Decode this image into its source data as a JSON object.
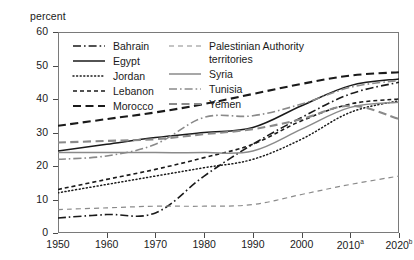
{
  "axis": {
    "y_title": "percent",
    "y_ticks": [
      0,
      10,
      20,
      30,
      40,
      50,
      60
    ],
    "x_ticks": [
      "1950",
      "1960",
      "1970",
      "1980",
      "1990",
      "2000",
      "2010",
      "2020"
    ],
    "x_tick_superscripts": [
      "",
      "",
      "",
      "",
      "",
      "",
      "a",
      "b"
    ]
  },
  "legend": {
    "col1": [
      {
        "label": "Bahrain",
        "style": "dash-dot",
        "color": "#1a1a1a"
      },
      {
        "label": "Egypt",
        "style": "solid",
        "color": "#1a1a1a"
      },
      {
        "label": "Jordan",
        "style": "dotted",
        "color": "#1a1a1a"
      },
      {
        "label": "Lebanon",
        "style": "short-dash",
        "color": "#1a1a1a"
      },
      {
        "label": "Morocco",
        "style": "long-dash",
        "color": "#1a1a1a"
      }
    ],
    "col2": [
      {
        "label": "Palestinian Authority\nterritories",
        "style": "fine-dash",
        "color": "#8a8a8a"
      },
      {
        "label": "Syria",
        "style": "solid",
        "color": "#8a8a8a"
      },
      {
        "label": "Tunisia",
        "style": "dash-dot",
        "color": "#8a8a8a"
      },
      {
        "label": "Yemen",
        "style": "long-dash",
        "color": "#8a8a8a"
      }
    ]
  },
  "chart_data": {
    "type": "line",
    "title": "",
    "xlabel": "",
    "ylabel": "percent",
    "xlim": [
      1950,
      2020
    ],
    "ylim": [
      0,
      60
    ],
    "grid": false,
    "legend_position": "top-left inside plot",
    "x": [
      1950,
      1960,
      1970,
      1980,
      1990,
      2000,
      2010,
      2020
    ],
    "x_labels": [
      "1950",
      "1960",
      "1970",
      "1980",
      "1990",
      "2000",
      "2010a",
      "2020b"
    ],
    "series": [
      {
        "name": "Bahrain",
        "style": "dash-dot",
        "color": "#1a1a1a",
        "values": [
          4.5,
          5.5,
          6.0,
          17.0,
          26.5,
          34.5,
          41.5,
          45.0
        ]
      },
      {
        "name": "Egypt",
        "style": "solid",
        "color": "#1a1a1a",
        "values": [
          24.5,
          26.5,
          28.5,
          30.0,
          31.5,
          38.0,
          44.0,
          46.0
        ]
      },
      {
        "name": "Jordan",
        "style": "dotted",
        "color": "#1a1a1a",
        "values": [
          12.0,
          14.5,
          17.0,
          19.5,
          22.0,
          28.0,
          36.0,
          39.5
        ]
      },
      {
        "name": "Lebanon",
        "style": "short-dash",
        "color": "#1a1a1a",
        "values": [
          13.0,
          16.0,
          19.0,
          22.5,
          26.5,
          33.5,
          38.5,
          40.0
        ]
      },
      {
        "name": "Morocco",
        "style": "long-dash",
        "color": "#1a1a1a",
        "values": [
          32.0,
          34.0,
          36.0,
          38.5,
          41.5,
          44.5,
          47.0,
          48.0
        ]
      },
      {
        "name": "Palestinian Authority territories",
        "style": "fine-dash",
        "color": "#8a8a8a",
        "values": [
          7.0,
          7.5,
          8.0,
          8.0,
          8.5,
          11.5,
          14.5,
          17.0
        ]
      },
      {
        "name": "Syria",
        "style": "solid",
        "color": "#8a8a8a",
        "values": [
          24.0,
          24.0,
          24.0,
          24.0,
          24.5,
          31.0,
          37.5,
          39.0
        ]
      },
      {
        "name": "Tunisia",
        "style": "dash-dot",
        "color": "#8a8a8a",
        "values": [
          22.0,
          23.0,
          26.5,
          34.5,
          35.0,
          38.5,
          43.5,
          45.5
        ]
      },
      {
        "name": "Yemen",
        "style": "long-dash",
        "color": "#8a8a8a",
        "values": [
          27.0,
          27.5,
          28.0,
          29.5,
          31.0,
          34.0,
          38.0,
          34.0
        ]
      }
    ]
  }
}
